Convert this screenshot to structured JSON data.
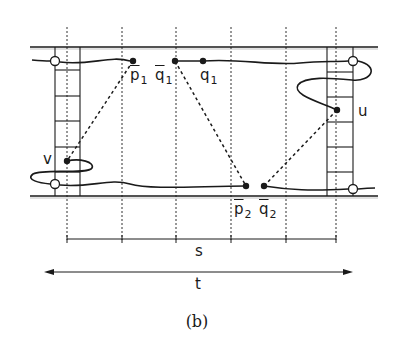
{
  "figure": {
    "caption": "(b)",
    "colors": {
      "ink": "#1a1a1a",
      "background": "#ffffff"
    }
  },
  "labels": {
    "p1": {
      "base": "p",
      "sub": "1",
      "bar": true
    },
    "q1bar": {
      "base": "q",
      "sub": "1",
      "bar": true
    },
    "q1": {
      "base": "q",
      "sub": "1",
      "bar": false
    },
    "p2": {
      "base": "p",
      "sub": "2",
      "bar": true
    },
    "q2": {
      "base": "q",
      "sub": "2",
      "bar": true
    },
    "u": "u",
    "v": "v",
    "s": "s",
    "t": "t"
  },
  "points": [
    {
      "id": "p1_bar",
      "x": 133,
      "y": 61,
      "filled": true
    },
    {
      "id": "q1_bar",
      "x": 175,
      "y": 61,
      "filled": true
    },
    {
      "id": "q1",
      "x": 203,
      "y": 61,
      "filled": true
    },
    {
      "id": "p2_bar",
      "x": 246,
      "y": 186,
      "filled": true
    },
    {
      "id": "q2_bar",
      "x": 264,
      "y": 186,
      "filled": true
    },
    {
      "id": "u",
      "x": 337,
      "y": 110,
      "filled": true
    },
    {
      "id": "v",
      "x": 67,
      "y": 161,
      "filled": true
    },
    {
      "id": "left_top_port",
      "x": 55,
      "y": 61,
      "filled": false
    },
    {
      "id": "left_bottom_port",
      "x": 55,
      "y": 184,
      "filled": false
    },
    {
      "id": "right_top_port",
      "x": 353,
      "y": 61,
      "filled": false
    },
    {
      "id": "right_bottom_port",
      "x": 353,
      "y": 189,
      "filled": false
    }
  ],
  "grid": {
    "dotted_x": [
      67,
      122,
      176,
      231,
      286,
      336
    ],
    "top_rail_y": 47,
    "bottom_rail_y": 196
  },
  "dimensions": {
    "s": {
      "x_start": 67,
      "x_end": 336,
      "y": 239,
      "ticks": [
        67,
        122,
        176,
        231,
        286,
        336
      ]
    },
    "t": {
      "x_start": 45,
      "x_end": 352,
      "y": 272
    }
  }
}
